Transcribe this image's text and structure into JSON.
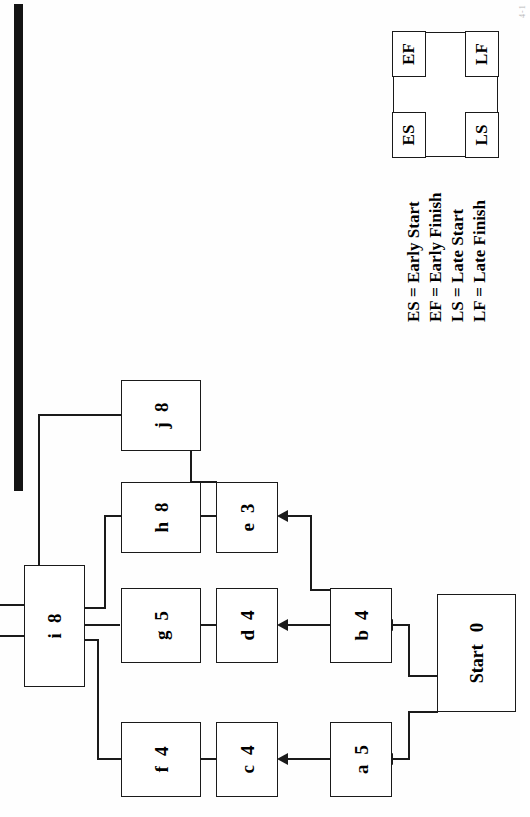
{
  "diagram": {
    "orientation": "rotated-90-ccw",
    "nodes": [
      {
        "id": "start",
        "label": "Start",
        "duration": "0"
      },
      {
        "id": "a",
        "label": "a",
        "duration": "5"
      },
      {
        "id": "b",
        "label": "b",
        "duration": "4"
      },
      {
        "id": "c",
        "label": "c",
        "duration": "4"
      },
      {
        "id": "d",
        "label": "d",
        "duration": "4"
      },
      {
        "id": "e",
        "label": "e",
        "duration": "3"
      },
      {
        "id": "f",
        "label": "f",
        "duration": "4"
      },
      {
        "id": "g",
        "label": "g",
        "duration": "5"
      },
      {
        "id": "h",
        "label": "h",
        "duration": "8"
      },
      {
        "id": "j",
        "label": "j",
        "duration": "8"
      },
      {
        "id": "i",
        "label": "i",
        "duration": "8"
      },
      {
        "id": "end",
        "label": "End",
        "duration": ""
      }
    ],
    "edges": [
      {
        "from": "start",
        "to": "a"
      },
      {
        "from": "start",
        "to": "b"
      },
      {
        "from": "a",
        "to": "c"
      },
      {
        "from": "c",
        "to": "f"
      },
      {
        "from": "b",
        "to": "d"
      },
      {
        "from": "b",
        "to": "e"
      },
      {
        "from": "d",
        "to": "g"
      },
      {
        "from": "e",
        "to": "h"
      },
      {
        "from": "e",
        "to": "j"
      },
      {
        "from": "f",
        "to": "i"
      },
      {
        "from": "g",
        "to": "i"
      },
      {
        "from": "h",
        "to": "i"
      },
      {
        "from": "i",
        "to": "end"
      },
      {
        "from": "j",
        "to": "end"
      }
    ]
  },
  "key_box": {
    "cells": [
      {
        "id": "es",
        "label": "ES"
      },
      {
        "id": "ef",
        "label": "EF"
      },
      {
        "id": "ls",
        "label": "LS"
      },
      {
        "id": "lf",
        "label": "LF"
      }
    ]
  },
  "legend": {
    "lines": [
      "ES = Early Start",
      "EF = Early Finish",
      "LS = Late Start",
      "LF = Late Finish"
    ]
  },
  "artifacts": {
    "corner_mark": "4-1"
  },
  "colors": {
    "ink": "#1a1a1a",
    "paper": "#fefefe",
    "scan_bar": "#141414"
  }
}
